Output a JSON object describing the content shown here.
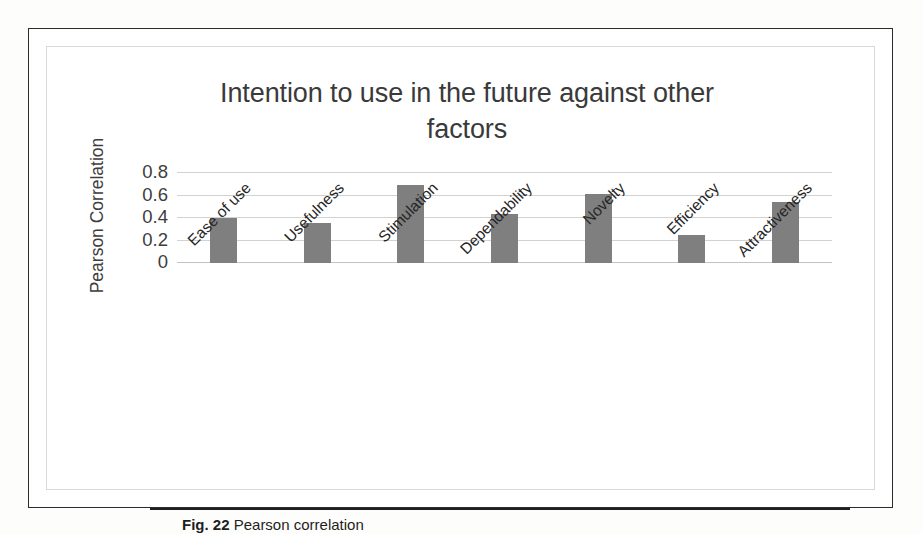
{
  "figure": {
    "caption_label": "Fig. 22",
    "caption_text": "Pearson correlation"
  },
  "chart_data": {
    "type": "bar",
    "title": "Intention to use in the future against other factors",
    "title_line1": "Intention to use in the future against other",
    "title_line2": "factors",
    "xlabel": "",
    "ylabel": "Pearson Correlation",
    "categories": [
      "Ease of use",
      "Usefulness",
      "Stimulation",
      "Dependability",
      "Novelty",
      "Efficiency",
      "Attractiveness"
    ],
    "values": [
      0.4,
      0.355,
      0.69,
      0.44,
      0.615,
      0.25,
      0.545
    ],
    "ylim": [
      0,
      0.8
    ],
    "yticks": [
      0,
      0.2,
      0.4,
      0.6,
      0.8
    ],
    "ytick_labels": [
      "0",
      "0.2",
      "0.4",
      "0.6",
      "0.8"
    ],
    "grid": true,
    "legend": false,
    "bar_color": "#7f7f7f",
    "gridline_color": "#d2d2d2",
    "text_color": "#3d3d3d"
  }
}
